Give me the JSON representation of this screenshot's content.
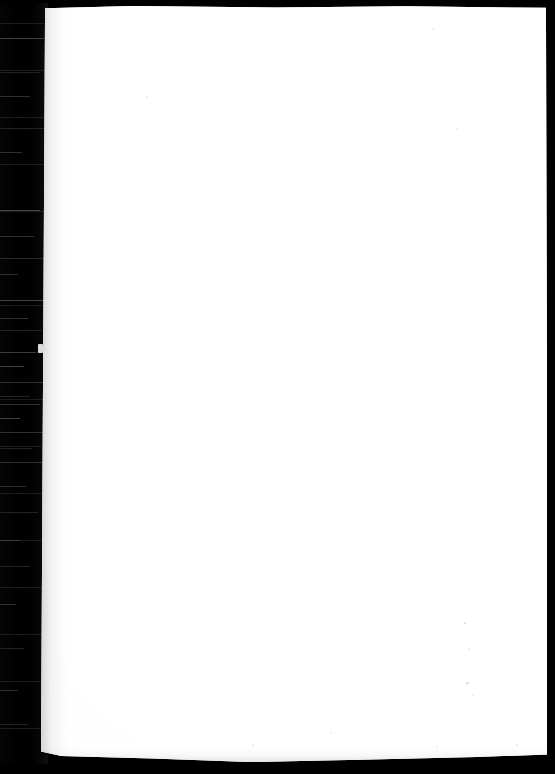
{
  "document": {
    "type": "scanned-page",
    "title": "Blank scanned page",
    "page_content": "",
    "visible_text": "",
    "notes": "Page is blank - no printed text, headings, figures or page number are visible in the scan."
  },
  "canvas": {
    "width_px": 555,
    "height_px": 774,
    "background_color": "#000000"
  },
  "page_sheet": {
    "label": "page-sheet",
    "paper_color": "#ffffff",
    "left_px": 41,
    "top_px": 4,
    "width_px": 507,
    "height_px": 758,
    "edge_shadow_color": "#000000"
  },
  "gutter": {
    "label": "binding-gutter-shadow",
    "color": "#000000",
    "width_px": 48,
    "streak_color": "#3a3a3a",
    "streak_rows": [
      38,
      72,
      96,
      128,
      152,
      210,
      236,
      258,
      274,
      300,
      318,
      330,
      352,
      366,
      382,
      396,
      404,
      418,
      432,
      448,
      462,
      486,
      512,
      540,
      566,
      604,
      648,
      690,
      724
    ]
  },
  "artifacts": {
    "edge_nick": {
      "label": "bright-edge-nick",
      "x_px": 38,
      "y_px": 344
    },
    "specks": [
      {
        "x_px": 146,
        "y_px": 96,
        "size_px": 2
      },
      {
        "x_px": 432,
        "y_px": 28,
        "size_px": 2
      },
      {
        "x_px": 456,
        "y_px": 128,
        "size_px": 2
      },
      {
        "x_px": 464,
        "y_px": 622,
        "size_px": 2
      },
      {
        "x_px": 468,
        "y_px": 648,
        "size_px": 2
      },
      {
        "x_px": 466,
        "y_px": 682,
        "size_px": 3
      },
      {
        "x_px": 472,
        "y_px": 694,
        "size_px": 2
      },
      {
        "x_px": 436,
        "y_px": 746,
        "size_px": 2
      },
      {
        "x_px": 516,
        "y_px": 744,
        "size_px": 2
      },
      {
        "x_px": 252,
        "y_px": 744,
        "size_px": 2
      },
      {
        "x_px": 330,
        "y_px": 732,
        "size_px": 2
      }
    ]
  }
}
